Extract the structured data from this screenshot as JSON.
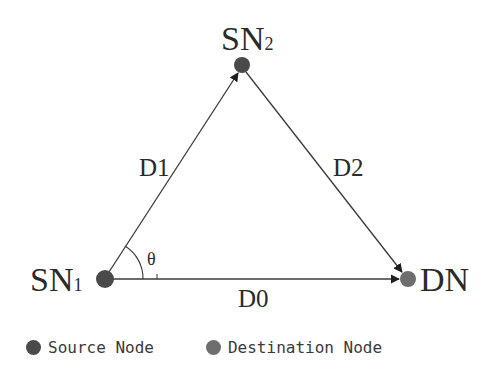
{
  "diagram": {
    "type": "network-topology-triangle",
    "nodes": [
      {
        "id": "SN1",
        "label": "SN",
        "subscript": "1",
        "role": "source",
        "x": 105,
        "y": 279
      },
      {
        "id": "SN2",
        "label": "SN",
        "subscript": "2",
        "role": "source",
        "x": 242,
        "y": 65
      },
      {
        "id": "DN",
        "label": "DN",
        "subscript": "",
        "role": "destination",
        "x": 408,
        "y": 279
      }
    ],
    "edges": [
      {
        "id": "D1",
        "label": "D1",
        "from": "SN1",
        "to": "SN2",
        "directed": true
      },
      {
        "id": "D2",
        "label": "D2",
        "from": "SN2",
        "to": "DN",
        "directed": true
      },
      {
        "id": "D0",
        "label": "D0",
        "from": "SN1",
        "to": "DN",
        "directed": true
      }
    ],
    "angle": {
      "label": "θ",
      "vertex": "SN1",
      "between": [
        "D1",
        "D0"
      ]
    }
  },
  "labels": {
    "sn1_main": "SN",
    "sn1_sub": "1",
    "sn2_main": "SN",
    "sn2_sub": "2",
    "dn": "DN",
    "d0": "D0",
    "d1": "D1",
    "d2": "D2",
    "theta": "θ"
  },
  "legend": {
    "items": [
      {
        "label": "Source Node",
        "color": "#4a4a4a"
      },
      {
        "label": "Destination Node",
        "color": "#6e6e6e"
      }
    ]
  },
  "colors": {
    "source_node": "#4a4a4a",
    "destination_node": "#6e6e6e",
    "edge": "#3a3a3a",
    "text": "#2a2a2a",
    "background": "#ffffff"
  }
}
